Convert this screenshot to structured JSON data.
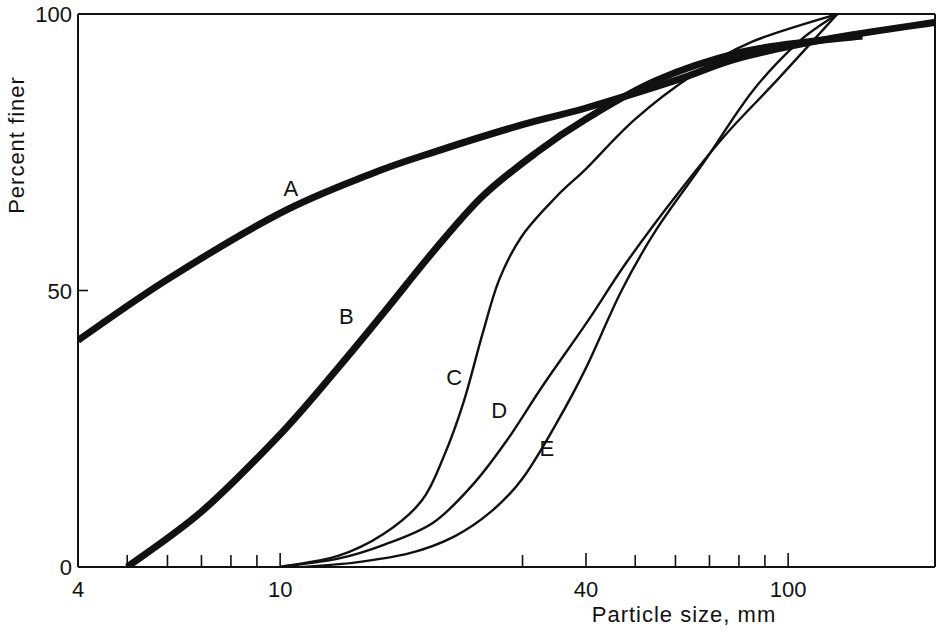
{
  "chart_data": {
    "type": "line",
    "title": "",
    "xlabel": "Particle size, mm",
    "ylabel": "Percent finer",
    "xscale": "log",
    "xlim": [
      4,
      195
    ],
    "ylim": [
      0,
      100
    ],
    "grid": false,
    "legend": "none (curves labelled inline)",
    "x_ticks": {
      "labelled": [
        {
          "value": 4,
          "label": "4"
        },
        {
          "value": 10,
          "label": "10"
        },
        {
          "value": 40,
          "label": "40"
        },
        {
          "value": 100,
          "label": "100"
        }
      ],
      "minor": [
        5,
        6,
        7,
        8,
        9,
        30,
        50,
        60,
        70,
        80,
        90
      ]
    },
    "y_ticks": [
      {
        "value": 0,
        "label": "0"
      },
      {
        "value": 50,
        "label": "50"
      },
      {
        "value": 100,
        "label": "100"
      }
    ],
    "series": [
      {
        "name": "A",
        "weight": "heavy",
        "label_at": [
          10.5,
          67
        ],
        "points": [
          [
            4,
            41
          ],
          [
            6,
            52
          ],
          [
            10,
            64
          ],
          [
            15,
            71
          ],
          [
            20,
            75
          ],
          [
            30,
            80
          ],
          [
            40,
            83
          ],
          [
            60,
            88
          ],
          [
            80,
            92
          ],
          [
            120,
            95.5
          ],
          [
            195,
            98.5
          ]
        ]
      },
      {
        "name": "B",
        "weight": "heavy",
        "label_at": [
          13.5,
          44
        ],
        "points": [
          [
            5,
            0
          ],
          [
            7,
            10
          ],
          [
            10,
            24
          ],
          [
            13,
            36
          ],
          [
            16,
            46
          ],
          [
            20,
            57
          ],
          [
            25,
            67
          ],
          [
            32,
            75
          ],
          [
            40,
            81
          ],
          [
            55,
            88
          ],
          [
            80,
            93
          ],
          [
            110,
            95
          ],
          [
            140,
            96
          ]
        ]
      },
      {
        "name": "C",
        "weight": "light",
        "label_at": [
          22,
          33
        ],
        "points": [
          [
            10,
            0
          ],
          [
            13,
            2
          ],
          [
            16,
            6
          ],
          [
            19,
            12
          ],
          [
            21,
            20
          ],
          [
            23,
            30
          ],
          [
            25,
            42
          ],
          [
            27,
            52
          ],
          [
            30,
            60
          ],
          [
            35,
            67
          ],
          [
            40,
            72
          ],
          [
            50,
            81
          ],
          [
            65,
            89
          ],
          [
            85,
            95
          ],
          [
            125,
            100
          ]
        ]
      },
      {
        "name": "D",
        "weight": "light",
        "label_at": [
          27,
          27
        ],
        "points": [
          [
            10,
            0
          ],
          [
            13,
            1.5
          ],
          [
            16,
            4
          ],
          [
            20,
            8
          ],
          [
            24,
            15
          ],
          [
            28,
            23
          ],
          [
            33,
            33
          ],
          [
            40,
            44
          ],
          [
            48,
            55
          ],
          [
            60,
            67
          ],
          [
            75,
            78
          ],
          [
            95,
            88
          ],
          [
            125,
            100
          ]
        ]
      },
      {
        "name": "E",
        "weight": "light",
        "label_at": [
          33.5,
          20
        ],
        "points": [
          [
            11,
            0
          ],
          [
            14,
            0.8
          ],
          [
            18,
            2.5
          ],
          [
            22,
            5.5
          ],
          [
            26,
            10
          ],
          [
            30,
            16
          ],
          [
            35,
            26
          ],
          [
            40,
            36
          ],
          [
            47,
            50
          ],
          [
            55,
            61
          ],
          [
            68,
            73
          ],
          [
            85,
            86
          ],
          [
            105,
            95
          ],
          [
            125,
            100
          ]
        ]
      }
    ]
  }
}
